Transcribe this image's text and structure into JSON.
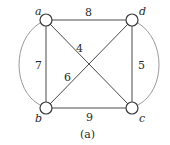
{
  "caption": "(a)",
  "nodes": [
    {
      "id": "a",
      "label": "a",
      "x": 46,
      "y": 20
    },
    {
      "id": "d",
      "label": "d",
      "x": 132,
      "y": 20
    },
    {
      "id": "b",
      "label": "b",
      "x": 46,
      "y": 108
    },
    {
      "id": "c",
      "label": "c",
      "x": 132,
      "y": 108
    }
  ],
  "edges": [
    {
      "from": "a",
      "to": "d",
      "weight": "8"
    },
    {
      "from": "a",
      "to": "c",
      "weight": "4"
    },
    {
      "from": "a",
      "to": "b",
      "weight": "7"
    },
    {
      "from": "b",
      "to": "d",
      "weight": "6"
    },
    {
      "from": "d",
      "to": "c",
      "weight": "5"
    },
    {
      "from": "b",
      "to": "c",
      "weight": "9"
    },
    {
      "from": "a",
      "to": "b",
      "weight": "",
      "curved": true
    },
    {
      "from": "d",
      "to": "c",
      "weight": "",
      "curved": true
    }
  ]
}
